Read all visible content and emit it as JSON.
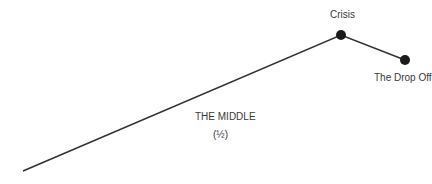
{
  "diagram": {
    "labels": {
      "crisis": "Crisis",
      "drop_off": "The Drop Off",
      "middle": "THE MIDDLE",
      "middle_sub": "(½)"
    },
    "points": [
      {
        "name": "start",
        "x": 23,
        "y": 171,
        "marker": false
      },
      {
        "name": "crisis",
        "x": 341,
        "y": 35,
        "marker": true
      },
      {
        "name": "drop_off",
        "x": 405,
        "y": 60,
        "marker": true
      }
    ],
    "colors": {
      "line": "#333333",
      "marker": "#1a1a1a",
      "text": "#3a3a3a"
    }
  }
}
